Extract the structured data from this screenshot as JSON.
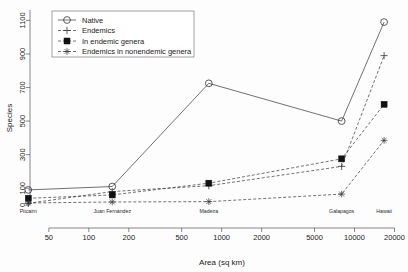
{
  "chart_data": {
    "type": "line",
    "title": "",
    "xlabel": "Area (sq km)",
    "ylabel": "Species",
    "xscale": "log",
    "xlim": [
      40,
      22000
    ],
    "ylim": [
      0,
      1150
    ],
    "grid": false,
    "legend_position": "top-left",
    "x_tick_labels": [
      "50",
      "100",
      "200",
      "500",
      "1000",
      "2000",
      "5000",
      "10000",
      "20000"
    ],
    "x_tick_values": [
      50,
      100,
      200,
      500,
      1000,
      2000,
      5000,
      10000,
      20000
    ],
    "y_tick_labels": [
      "0",
      "100",
      "300",
      "500",
      "700",
      "900",
      "1100"
    ],
    "y_tick_values": [
      0,
      100,
      300,
      500,
      700,
      900,
      1100
    ],
    "categories": [
      "Pitcairn",
      "Juan Fernández",
      "Madeira",
      "Galapagos",
      "Hawaii"
    ],
    "x": [
      35,
      150,
      800,
      8000,
      16700
    ],
    "series": [
      {
        "name": "Native",
        "marker": "open-circle",
        "linestyle": "solid",
        "values": [
          90,
          110,
          725,
          500,
          1090
        ]
      },
      {
        "name": "Endemics",
        "marker": "plus",
        "linestyle": "dashed",
        "values": [
          10,
          80,
          115,
          230,
          890
        ]
      },
      {
        "name": "In endemic genera",
        "marker": "filled-square",
        "linestyle": "dashed",
        "values": [
          40,
          60,
          130,
          275,
          600
        ]
      },
      {
        "name": "Endemics in nonendemic genera",
        "marker": "star",
        "linestyle": "dashed",
        "values": [
          12,
          18,
          20,
          65,
          385
        ]
      }
    ]
  },
  "legend": {
    "entries": [
      {
        "label": "Native"
      },
      {
        "label": "Endemics"
      },
      {
        "label": "In endemic genera"
      },
      {
        "label": "Endemics in nonendemic genera"
      }
    ]
  },
  "axes": {
    "x_title": "Area (sq km)",
    "y_title": "Species"
  },
  "colors": {
    "line": "#333333",
    "marker_fill": "#111111",
    "frame": "#555555",
    "background": "#fdfdfd"
  }
}
